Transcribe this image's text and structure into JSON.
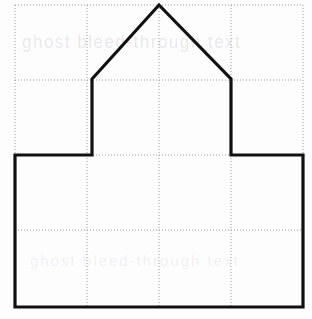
{
  "figure": {
    "background_color": "#fdfdfd",
    "ghost_text_top": "ghost bleed-through text",
    "ghost_text_bottom": "ghost bleed-through text"
  },
  "grid": {
    "color": "#9a9a9a",
    "style": "dotted",
    "stroke_width": 1,
    "dash_pattern": "1,2",
    "columns": 4,
    "rows": 4,
    "x_left": 15,
    "x_right": 303,
    "y_top": 5,
    "y_bottom": 307,
    "cell_width": 72,
    "cell_height": 75.5,
    "vertical_lines_x": [
      15,
      87,
      159,
      231,
      303
    ],
    "horizontal_lines_y": [
      5,
      80,
      155,
      230,
      307
    ]
  },
  "shape": {
    "name": "house-polygon",
    "stroke_color": "#111111",
    "stroke_width": 3.2,
    "fill": "none",
    "vertex_count": 9,
    "vertices": [
      {
        "label": "roof-apex",
        "x": 159,
        "y": 5
      },
      {
        "label": "right-eave",
        "x": 231,
        "y": 79
      },
      {
        "label": "right-wall-base",
        "x": 231,
        "y": 155
      },
      {
        "label": "right-outer-top",
        "x": 303,
        "y": 155
      },
      {
        "label": "right-outer-base",
        "x": 303,
        "y": 307
      },
      {
        "label": "left-outer-base",
        "x": 15,
        "y": 307
      },
      {
        "label": "left-outer-top",
        "x": 15,
        "y": 155
      },
      {
        "label": "left-wall-base",
        "x": 92,
        "y": 155
      },
      {
        "label": "left-eave",
        "x": 92,
        "y": 79
      }
    ],
    "points_string": "159,5 231,79 231,155 303,155 303,307 15,307 15,155 92,155 92,79"
  }
}
